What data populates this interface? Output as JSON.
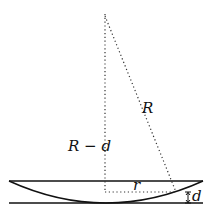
{
  "diagram": {
    "labels": {
      "hypotenuse": "R",
      "vertical": "R − d",
      "horizontal": "r",
      "sag": "d"
    },
    "colors": {
      "line": "#111111",
      "dotted": "#333333",
      "background": "#ffffff"
    }
  }
}
